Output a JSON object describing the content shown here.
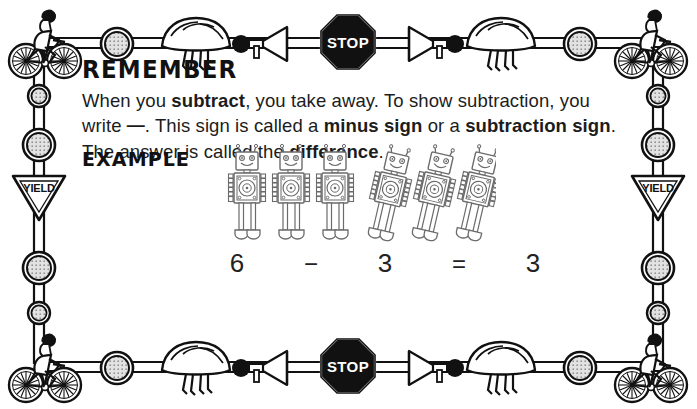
{
  "worksheet": {
    "heading": "REMEMBER",
    "body_line1_pre": "When you ",
    "body_bold1": "subtract",
    "body_line1_post": ", you take away. To show subtraction, you write ",
    "minus_glyph": "—",
    "body_line2": ". This sign is called a ",
    "body_bold2": "minus sign",
    "body_line3": " or a ",
    "body_bold3": "subtraction sign",
    "body_line4": ". The answer is called the ",
    "body_bold4": "difference",
    "body_end": ".",
    "example_label": "EXAMPLE"
  },
  "equation": {
    "minuend": "6",
    "operator": "−",
    "subtrahend": "3",
    "equals": "=",
    "difference": "3"
  },
  "robots": {
    "upright_count": 3,
    "tilted_count": 3,
    "upright": [
      {
        "state": "standing"
      },
      {
        "state": "standing"
      },
      {
        "state": "standing"
      }
    ],
    "tilted": [
      {
        "state": "falling"
      },
      {
        "state": "falling"
      },
      {
        "state": "falling"
      }
    ]
  },
  "border": {
    "theme": "bicycle-safety",
    "stop_sign_label": "STOP",
    "yield_sign_label": "YIELD",
    "top_items": [
      "cyclist",
      "reflector",
      "helmet",
      "horn",
      "stop-sign",
      "horn",
      "helmet",
      "reflector",
      "cyclist"
    ],
    "bottom_items": [
      "cyclist",
      "reflector",
      "helmet",
      "horn",
      "stop-sign",
      "horn",
      "helmet",
      "reflector",
      "cyclist"
    ],
    "left_items": [
      "reflector",
      "reflector",
      "yield-sign",
      "reflector",
      "reflector"
    ],
    "right_items": [
      "reflector",
      "reflector",
      "yield-sign",
      "reflector",
      "reflector"
    ]
  },
  "colors": {
    "ink": "#1a1a1a",
    "paper": "#ffffff",
    "sign_fill": "#111111",
    "sign_text": "#ffffff",
    "reflector_fill": "#dedede"
  }
}
